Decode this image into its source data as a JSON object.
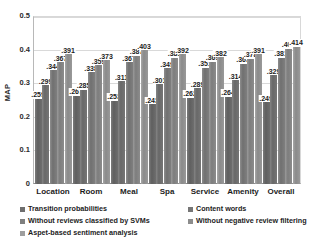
{
  "chart_data": {
    "type": "bar",
    "title": "",
    "xlabel": "",
    "ylabel": "MAP",
    "ylim": [
      0,
      0.5
    ],
    "yticks": [
      "0",
      "0.1",
      "0.2",
      "0.3",
      "0.4",
      "0.5"
    ],
    "grid": true,
    "legend_position": "bottom",
    "categories": [
      "Location",
      "Room",
      "Meal",
      "Spa",
      "Service",
      "Amenity",
      "Overall"
    ],
    "series": [
      {
        "name": "Transition probabilities",
        "color": "#6e6e6e",
        "values": [
          0.259,
          0.267,
          0.253,
          0.243,
          0.262,
          0.264,
          0.249
        ],
        "labels": [
          ".259",
          ".267",
          ".253",
          ".243",
          ".262",
          ".264",
          ".249"
        ]
      },
      {
        "name": "Content words",
        "color": "#767676",
        "values": [
          0.299,
          0.285,
          0.311,
          0.301,
          0.289,
          0.314,
          0.329
        ],
        "labels": [
          ".299",
          ".285",
          ".311",
          ".301",
          ".289",
          ".314",
          ".329"
        ]
      },
      {
        "name": "Without reviews classified by SVMs",
        "color": "#7f7f7f",
        "values": [
          0.344,
          0.338,
          0.367,
          0.349,
          0.351,
          0.363,
          0.381
        ],
        "labels": [
          ".344",
          ".338",
          ".367",
          ".349",
          ".351",
          ".363",
          ".381"
        ]
      },
      {
        "name": "Without negative review filtering",
        "color": "#8c8c8c",
        "values": [
          0.367,
          0.359,
          0.387,
          0.381,
          0.369,
          0.378,
          0.408
        ],
        "labels": [
          ".367",
          ".359",
          ".387",
          ".381",
          ".369",
          ".378",
          ".408"
        ]
      },
      {
        "name": "Aspet-based sentiment analysis",
        "color": "#9e9e9e",
        "values": [
          0.391,
          0.373,
          0.403,
          0.392,
          0.382,
          0.391,
          0.414
        ],
        "labels": [
          ".391",
          ".373",
          ".403",
          ".392",
          ".382",
          ".391",
          ".414"
        ]
      }
    ]
  },
  "legend": {
    "items": [
      {
        "label": "Transition probabilities",
        "swatch": "sw0",
        "col": "col-l"
      },
      {
        "label": "Content words",
        "swatch": "sw1",
        "col": "col-r"
      },
      {
        "label": "Without reviews classified by SVMs",
        "swatch": "sw2",
        "col": "col-l"
      },
      {
        "label": "Without negative review filtering",
        "swatch": "sw3",
        "col": "col-r"
      },
      {
        "label": "Aspet-based sentiment analysis",
        "swatch": "sw4",
        "col": "col-l"
      }
    ]
  }
}
